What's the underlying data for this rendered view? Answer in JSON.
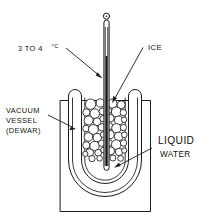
{
  "figure": {
    "background_color": "#ffffff",
    "line_color": "#1a1a1a"
  },
  "labels": {
    "temperature": {
      "text": "3 TO 4",
      "degree": "°C",
      "full": "3 TO 4°C",
      "name": "temperature-label"
    },
    "ice": {
      "text": "ICE",
      "name": "ice-label"
    },
    "vessel": {
      "line1": "VACUUM",
      "line2": "VESSEL",
      "line3": "(DEWAR)",
      "full": "VACUUM VESSEL (DEWAR)",
      "name": "vacuum-vessel-label"
    },
    "water": {
      "line1": "LIQUID",
      "line2": "WATER",
      "full": "LIQUID WATER",
      "name": "liquid-water-label"
    }
  },
  "parts": {
    "thermometer": "thermometer",
    "mercury_column": "mercury-column",
    "thermometer_loop": "thermometer-top-loop",
    "dewar_outer_box": "vacuum-jacket-outer-box",
    "dewar_outer_wall": "dewar-outer-wall",
    "dewar_inner_wall": "dewar-inner-wall",
    "ice_pack": "ice-pack",
    "liquid_water": "liquid-water-region"
  }
}
